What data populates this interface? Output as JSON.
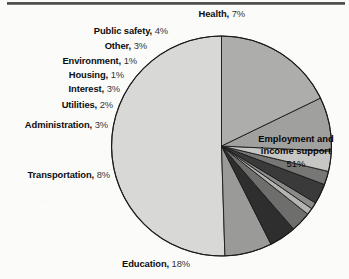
{
  "chart_data": {
    "type": "pie",
    "title": "",
    "subtitle": "",
    "xlabel": "",
    "ylabel": "",
    "legend_position": "none-labels-are-callouts",
    "grid": false,
    "units": "percent",
    "total": 101,
    "start_angle_deg": 0,
    "direction": "counterclockwise",
    "categories": [
      "Employment and income support",
      "Health",
      "Public safety",
      "Other",
      "Environment",
      "Housing",
      "Interest",
      "Utilities",
      "Administration",
      "Transportation",
      "Education"
    ],
    "values": [
      51,
      7,
      4,
      3,
      1,
      1,
      3,
      2,
      3,
      8,
      18
    ],
    "slices": [
      {
        "name": "Employment and income support",
        "value": 51,
        "label_text": "Employment and income support",
        "percent_text": "51%",
        "color": "#d8d8d6",
        "label_placement": "inside"
      },
      {
        "name": "Health",
        "value": 7,
        "label_text": "Health",
        "percent_text": "7%",
        "color": "#9a9a98",
        "label_placement": "outside"
      },
      {
        "name": "Public safety",
        "value": 4,
        "label_text": "Public safety",
        "percent_text": "4%",
        "color": "#2e2e2e",
        "label_placement": "outside"
      },
      {
        "name": "Other",
        "value": 3,
        "label_text": "Other",
        "percent_text": "3%",
        "color": "#6e6e6c",
        "label_placement": "outside"
      },
      {
        "name": "Environment",
        "value": 1,
        "label_text": "Environment",
        "percent_text": "1%",
        "color": "#b4b4b2",
        "label_placement": "outside"
      },
      {
        "name": "Housing",
        "value": 1,
        "label_text": "Housing",
        "percent_text": "1%",
        "color": "#8a8a88",
        "label_placement": "outside"
      },
      {
        "name": "Interest",
        "value": 3,
        "label_text": "Interest",
        "percent_text": "3%",
        "color": "#3a3a3a",
        "label_placement": "outside"
      },
      {
        "name": "Utilities",
        "value": 2,
        "label_text": "Utilities",
        "percent_text": "2%",
        "color": "#777775",
        "label_placement": "outside"
      },
      {
        "name": "Administration",
        "value": 3,
        "label_text": "Administration",
        "percent_text": "3%",
        "color": "#c6c6c4",
        "label_placement": "outside"
      },
      {
        "name": "Transportation",
        "value": 8,
        "label_text": "Transportation",
        "percent_text": "8%",
        "color": "#a0a09e",
        "label_placement": "outside"
      },
      {
        "name": "Education",
        "value": 18,
        "label_text": "Education",
        "percent_text": "18%",
        "color": "#adadab",
        "label_placement": "outside"
      }
    ]
  },
  "labels": {
    "health": {
      "cat": "Health,",
      "pct": "7%"
    },
    "public_safety": {
      "cat": "Public safety,",
      "pct": "4%"
    },
    "other": {
      "cat": "Other,",
      "pct": "3%"
    },
    "environment": {
      "cat": "Environment,",
      "pct": "1%"
    },
    "housing": {
      "cat": "Housing,",
      "pct": "1%"
    },
    "interest": {
      "cat": "Interest,",
      "pct": "3%"
    },
    "utilities": {
      "cat": "Utilities,",
      "pct": "2%"
    },
    "administration": {
      "cat": "Administration,",
      "pct": "3%"
    },
    "transportation": {
      "cat": "Transportation,",
      "pct": "8%"
    },
    "education": {
      "cat": "Education,",
      "pct": "18%"
    },
    "employment_line1": "Employment and",
    "employment_line2": "income support",
    "employment_pct": "51%"
  },
  "style": {
    "background": "#fbfbfa",
    "outline": "#1a1a1a",
    "text": "#0d0d0d"
  }
}
